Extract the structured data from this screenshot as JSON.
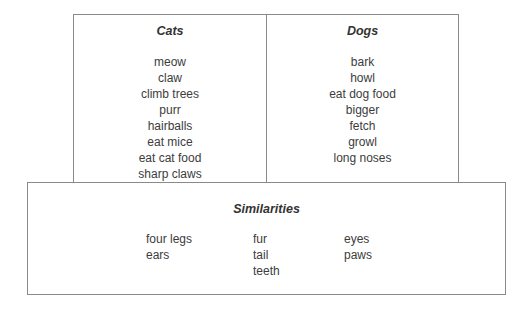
{
  "diagram": {
    "type": "venn-style comparison chart",
    "cats": {
      "title": "Cats",
      "items": [
        "meow",
        "claw",
        "climb trees",
        "purr",
        "hairballs",
        "eat mice",
        "eat cat food",
        "sharp claws"
      ]
    },
    "dogs": {
      "title": "Dogs",
      "items": [
        "bark",
        "howl",
        "eat dog food",
        "bigger",
        "fetch",
        "growl",
        "long noses"
      ]
    },
    "similarities": {
      "title": "Similarities",
      "columns": [
        [
          "four legs",
          "ears"
        ],
        [
          "fur",
          "tail",
          "teeth"
        ],
        [
          "eyes",
          "paws"
        ]
      ]
    },
    "colors": {
      "border": "#8a8a8a",
      "text": "#3c3c3c",
      "background": "#ffffff"
    }
  }
}
